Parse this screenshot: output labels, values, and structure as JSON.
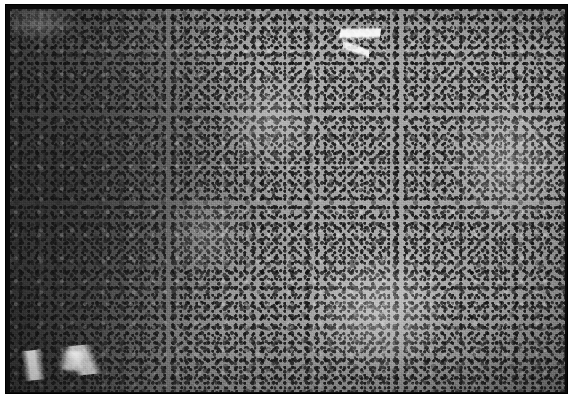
{
  "figure": {
    "domain": "histopathology micrograph",
    "modality": "light microscopy",
    "stain": "hematoxylin and eosin",
    "color_mode": "grayscale",
    "caption": "",
    "label": "",
    "magnification": "",
    "scale_bar": ""
  },
  "frame": {
    "border_color": "#0b0b0b",
    "page_background": "#ffffff",
    "border_width_px": 5,
    "margin_left_px": 5,
    "margin_top_px": 4
  },
  "image": {
    "x": 10,
    "y": 9,
    "width": 555,
    "height": 383,
    "base_tone": "#8d8d8d",
    "dark_tone": "#5e5e5e",
    "light_tone": "#b4b4b4",
    "nuclei_tone": "#1e1e1e",
    "highlight_tone": "#f6f6f6"
  },
  "regions": [
    {
      "name": "dense-lymphoid-zone",
      "description": "densely packed small dark nuclei occupying the left third of the field",
      "position": "left",
      "relative_density": "high",
      "mean_tone": "#6b6b6b"
    },
    {
      "name": "pale-transition-zone",
      "description": "lighter zone with more abundant cytoplasm and more widely spaced nuclei",
      "position": "center",
      "relative_density": "medium",
      "mean_tone": "#9b9b9b"
    },
    {
      "name": "sheet-like-zone",
      "description": "sheets of larger paler cells with scattered nuclei toward the right margin",
      "position": "right",
      "relative_density": "medium-low",
      "mean_tone": "#a2a2a2"
    },
    {
      "name": "dark-band-inferior",
      "description": "darker nuclei-rich band along the lower border",
      "position": "bottom",
      "relative_density": "high",
      "mean_tone": "#6f6f6f"
    }
  ],
  "features": [
    {
      "name": "vascular-cleft-superior",
      "description": "bright linear cleft / vessel lumen running obliquely near the upper right of centre",
      "x": 330,
      "y": 5,
      "width": 40,
      "height": 60,
      "tone": "#ffffff"
    },
    {
      "name": "pale-branching-streak-inferior-left",
      "description": "branching pale streak in the lower-left quadrant",
      "x": 8,
      "y": 336,
      "width": 130,
      "height": 30,
      "tone": "#fafafa"
    },
    {
      "name": "pale-patch-superior-left",
      "description": "small pale patch near the upper left corner",
      "x": 0,
      "y": 0,
      "width": 70,
      "height": 34,
      "tone": "#ebebeb"
    }
  ]
}
